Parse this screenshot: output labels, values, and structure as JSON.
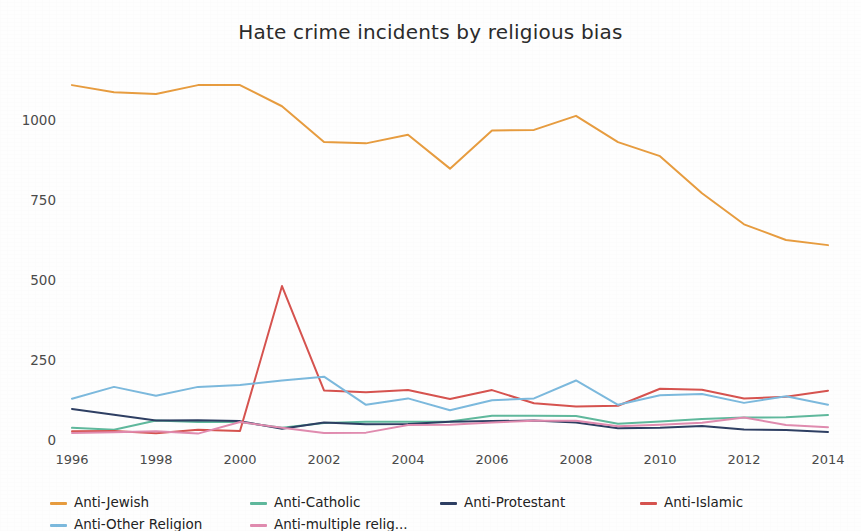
{
  "chart_data": {
    "type": "line",
    "title": "Hate crime incidents by religious bias",
    "xlabel": "",
    "ylabel": "",
    "grid": false,
    "legend_position": "bottom",
    "x": [
      1996,
      1997,
      1998,
      1999,
      2000,
      2001,
      2002,
      2003,
      2004,
      2005,
      2006,
      2007,
      2008,
      2009,
      2010,
      2011,
      2012,
      2013,
      2014
    ],
    "xticks": [
      "1996",
      "1998",
      "2000",
      "2002",
      "2004",
      "2006",
      "2008",
      "2010",
      "2012",
      "2014"
    ],
    "yticks": [
      "0",
      "250",
      "500",
      "750",
      "1000"
    ],
    "xlim": [
      1996,
      2014
    ],
    "ylim": [
      0,
      1180
    ],
    "series": [
      {
        "name": "Anti-Jewish",
        "color": "#E79C3F",
        "values": [
          1109,
          1087,
          1081,
          1109,
          1109,
          1043,
          931,
          927,
          954,
          848,
          967,
          969,
          1013,
          931,
          887,
          771,
          674,
          625,
          609
        ]
      },
      {
        "name": "Anti-Catholic",
        "color": "#5FB89C",
        "values": [
          38,
          32,
          61,
          56,
          56,
          38,
          53,
          57,
          57,
          58,
          76,
          76,
          75,
          51,
          58,
          66,
          70,
          71,
          78
        ]
      },
      {
        "name": "Anti-Protestant",
        "color": "#2E3F63",
        "values": [
          97,
          79,
          61,
          62,
          59,
          35,
          55,
          49,
          50,
          57,
          59,
          61,
          55,
          37,
          38,
          44,
          33,
          31,
          25
        ]
      },
      {
        "name": "Anti-Islamic",
        "color": "#D6534F",
        "values": [
          27,
          28,
          21,
          32,
          28,
          481,
          155,
          149,
          156,
          128,
          156,
          115,
          105,
          107,
          160,
          157,
          130,
          135,
          154
        ]
      },
      {
        "name": "Anti-Other Religion",
        "color": "#7CB9DD",
        "values": [
          129,
          166,
          138,
          166,
          172,
          186,
          198,
          110,
          130,
          93,
          124,
          130,
          186,
          110,
          140,
          144,
          116,
          137,
          110
        ]
      },
      {
        "name": "Anti-multiple relig...",
        "color": "#E08BAF",
        "values": [
          22,
          24,
          27,
          20,
          56,
          38,
          22,
          23,
          47,
          48,
          55,
          60,
          60,
          43,
          48,
          54,
          70,
          47,
          40
        ]
      }
    ]
  },
  "legend": {
    "items": [
      {
        "label": "Anti-Jewish",
        "color": "#E79C3F"
      },
      {
        "label": "Anti-Catholic",
        "color": "#5FB89C"
      },
      {
        "label": "Anti-Protestant",
        "color": "#2E3F63"
      },
      {
        "label": "Anti-Islamic",
        "color": "#D6534F"
      },
      {
        "label": "Anti-Other Religion",
        "color": "#7CB9DD"
      },
      {
        "label": "Anti-multiple relig...",
        "color": "#E08BAF"
      }
    ]
  }
}
